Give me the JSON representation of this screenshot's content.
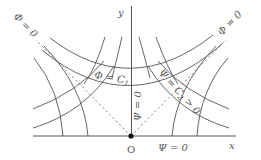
{
  "diagram": {
    "title": "",
    "axes": {
      "x_label": "x",
      "y_label": "y",
      "origin_label": "O"
    },
    "labels": {
      "phi_zero_left": "Φ = 0",
      "phi_zero_right": "Φ = 0",
      "phi_c1": "Φ = C",
      "phi_c1_sub": "1",
      "psi_c2": "Ψ = C",
      "psi_c2_sub": "2",
      "psi_c2_tail": " > 0",
      "psi_zero_vertical": "Ψ = 0",
      "psi_zero_horizontal": "Ψ = 0"
    },
    "colors": {
      "line": "#555555",
      "dashed": "#777777",
      "background": "#ffffff"
    },
    "curve_families": [
      {
        "name": "Φ = const (upper, crossing y-axis)",
        "count": 2
      },
      {
        "name": "Φ = const (lower side branches)",
        "count": 4
      },
      {
        "name": "Ψ = const (from x-axis)",
        "count": 4
      },
      {
        "name": "Ψ = const (upper)",
        "count": 4
      },
      {
        "name": "Φ = 0 asymptotes (dashed diagonals)",
        "count": 2
      }
    ]
  }
}
